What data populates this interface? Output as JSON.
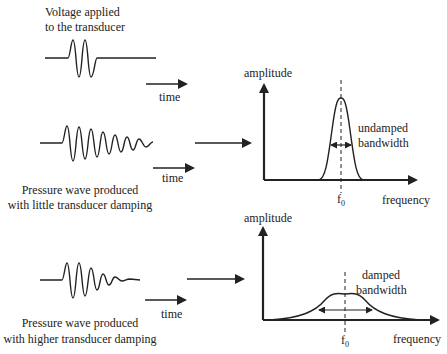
{
  "labels": {
    "voltage_line1": "Voltage applied",
    "voltage_line2": "to the transducer",
    "time": "time",
    "undamped_caption_line1": "Pressure wave produced",
    "undamped_caption_line2": "with little transducer damping",
    "damped_caption_line1": "Pressure wave produced",
    "damped_caption_line2": "with higher transducer damping"
  },
  "top_chart": {
    "ylabel": "amplitude",
    "xlabel": "frequency",
    "center_tick": "f",
    "center_sub": "0",
    "annotation_line1": "undamped",
    "annotation_line2": "bandwidth"
  },
  "bottom_chart": {
    "ylabel": "amplitude",
    "xlabel": "frequency",
    "center_tick": "f",
    "center_sub": "0",
    "annotation_line1": "damped",
    "annotation_line2": "bandwidth"
  },
  "colors": {
    "stroke": "#222222",
    "background": "#ffffff"
  }
}
